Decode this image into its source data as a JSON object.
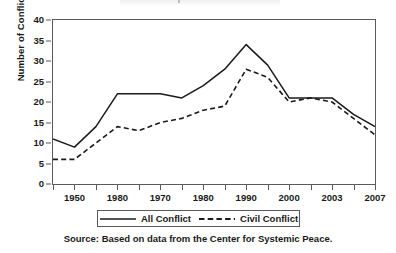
{
  "chart_data": {
    "type": "line",
    "title": "",
    "xlabel": "",
    "ylabel": "Number of Conflicts",
    "ylim": [
      0,
      40
    ],
    "yticks": [
      0,
      5,
      10,
      15,
      20,
      25,
      30,
      35,
      40
    ],
    "grid": false,
    "legend_position": "below-axes",
    "x_tick_labels": [
      "1950",
      "1980",
      "1970",
      "1980",
      "1990",
      "2000",
      "2003",
      "2007"
    ],
    "x_index": [
      0,
      1,
      2,
      3,
      4,
      5,
      6,
      7,
      8,
      9,
      10,
      11,
      12,
      13,
      14,
      15
    ],
    "series": [
      {
        "name": "All Conflict",
        "style": "solid",
        "color": "#1a1a1a",
        "values": [
          11,
          9,
          14,
          22,
          22,
          22,
          21,
          24,
          28,
          34,
          29,
          21,
          21,
          21,
          17,
          14
        ]
      },
      {
        "name": "Civil Conflict",
        "style": "dashed",
        "color": "#1a1a1a",
        "values": [
          6,
          6,
          10,
          14,
          13,
          15,
          16,
          18,
          19,
          28,
          26,
          20,
          21,
          20,
          16,
          12
        ]
      }
    ],
    "source_note": "Source: Based on data from the Center for Systemic Peace."
  },
  "legend": {
    "items": [
      {
        "label": "All Conflict",
        "style": "solid"
      },
      {
        "label": "Civil Conflict",
        "style": "dashed"
      }
    ]
  }
}
